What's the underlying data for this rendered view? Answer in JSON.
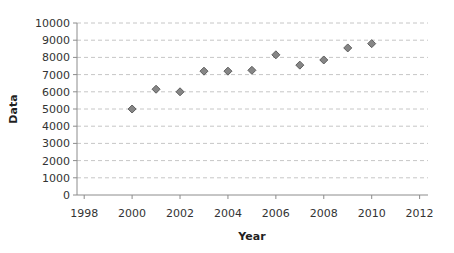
{
  "chart_data": {
    "type": "scatter",
    "title": "",
    "xlabel": "Year",
    "ylabel": "Data",
    "xlim": [
      1997.7,
      2012.35
    ],
    "ylim": [
      0,
      10000
    ],
    "x_ticks": [
      1998,
      2000,
      2002,
      2004,
      2006,
      2008,
      2010,
      2012
    ],
    "y_ticks": [
      0,
      1000,
      2000,
      3000,
      4000,
      5000,
      6000,
      7000,
      8000,
      9000,
      10000
    ],
    "grid": "horizontal-dashed",
    "legend": "none",
    "points": [
      {
        "x": 2000,
        "y": 5000
      },
      {
        "x": 2001,
        "y": 6150
      },
      {
        "x": 2002,
        "y": 6000
      },
      {
        "x": 2003,
        "y": 7200
      },
      {
        "x": 2004,
        "y": 7200
      },
      {
        "x": 2005,
        "y": 7250
      },
      {
        "x": 2006,
        "y": 8150
      },
      {
        "x": 2007,
        "y": 7550
      },
      {
        "x": 2008,
        "y": 7850
      },
      {
        "x": 2009,
        "y": 8550
      },
      {
        "x": 2010,
        "y": 8800
      }
    ],
    "marker": {
      "shape": "diamond",
      "size": 8,
      "fill": "#868686",
      "stroke": "#5e5e5e"
    },
    "colors": {
      "background": "#ffffff",
      "grid": "#c6c6c6",
      "axis": "#8c8c8c",
      "tick_text": "#333333",
      "title_text": "#1f1f1f"
    }
  }
}
